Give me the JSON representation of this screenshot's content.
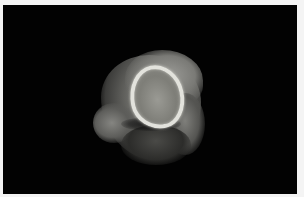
{
  "image": {
    "description": "Photograph of an irregular gray specimen with a bright oval rim on a black background",
    "background_color": "#020202",
    "border_color": "#f4f4f4",
    "subject_colors": {
      "rim": "#e2e2dc",
      "interior": "#8c8c86",
      "tissue": "#6a6a66"
    }
  }
}
